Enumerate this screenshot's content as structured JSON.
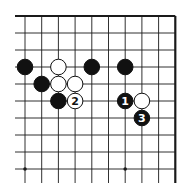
{
  "diagram": {
    "type": "go-board-fragment",
    "grid": {
      "x0": 25,
      "y0": 16,
      "dx": 16.7,
      "dy": 17,
      "cols": 10,
      "rows": 10,
      "left_extend_to": 15,
      "bottom_extend_to": 183,
      "top_edge": true,
      "right_edge": true,
      "line_color": "#1a1a1a"
    },
    "star_points": [
      {
        "col": 0,
        "row": 9
      },
      {
        "col": 6,
        "row": 9
      }
    ],
    "stones": [
      {
        "color": "black",
        "col": 0,
        "row": 3,
        "label": ""
      },
      {
        "color": "white",
        "col": 2,
        "row": 3,
        "label": ""
      },
      {
        "color": "black",
        "col": 4,
        "row": 3,
        "label": ""
      },
      {
        "color": "black",
        "col": 6,
        "row": 3,
        "label": ""
      },
      {
        "color": "black",
        "col": 1,
        "row": 4,
        "label": ""
      },
      {
        "color": "white",
        "col": 2,
        "row": 4,
        "label": ""
      },
      {
        "color": "white",
        "col": 3,
        "row": 4,
        "label": ""
      },
      {
        "color": "black",
        "col": 2,
        "row": 5,
        "label": ""
      },
      {
        "color": "white",
        "col": 3,
        "row": 5,
        "label": "2"
      },
      {
        "color": "black",
        "col": 6,
        "row": 5,
        "label": "1"
      },
      {
        "color": "white",
        "col": 7,
        "row": 5,
        "label": ""
      },
      {
        "color": "black",
        "col": 7,
        "row": 6,
        "label": "3"
      }
    ],
    "colors": {
      "black_stone": "#111111",
      "white_stone": "#ffffff",
      "stone_outline": "#111111",
      "background": "#ffffff"
    }
  }
}
